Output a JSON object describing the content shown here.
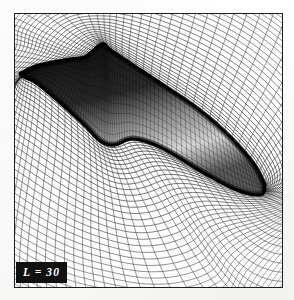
{
  "figure": {
    "kind": "cfd-computational-grid",
    "caption_label": "L = 30",
    "frame": {
      "x": 14,
      "y": 13,
      "width": 269,
      "height": 275,
      "border_color": "#1d1d1d",
      "background_color": "#ffffff"
    },
    "label_badge": {
      "text": "L = 30",
      "background_color": "#111111",
      "text_color": "#ffffff",
      "position": "bottom-left"
    },
    "grid": {
      "type": "body-fitted-c-grid",
      "line_color": "#2a2a2a",
      "radial_lines": 96,
      "circumferential_lines": 44,
      "description": "Curvilinear body-fitted mesh wrapped around slender hull"
    },
    "body": {
      "name": "slender-hull",
      "fill_color": "#151515",
      "nose_point": [
        18,
        72
      ],
      "tail_point": [
        255,
        185
      ],
      "features": [
        "sail-fin",
        "lower-bulge",
        "tapered-tail"
      ]
    }
  },
  "chart_data": {
    "type": "line",
    "title": "L = 30",
    "xlabel": "",
    "ylabel": "",
    "xlim": [
      0,
      269
    ],
    "ylim": [
      0,
      275
    ],
    "grid": true,
    "legend": "none",
    "annotations": [
      "L = 30"
    ],
    "series": [
      {
        "name": "body-surface-outline",
        "x": [
          5,
          22,
          52,
          68,
          75,
          88,
          96,
          120,
          150,
          185,
          215,
          240,
          252,
          248,
          225,
          190,
          150,
          120,
          100,
          86,
          70,
          46,
          22,
          10,
          5
        ],
        "y": [
          60,
          52,
          46,
          44,
          40,
          30,
          36,
          52,
          72,
          96,
          122,
          150,
          172,
          182,
          178,
          160,
          136,
          126,
          132,
          128,
          112,
          90,
          70,
          64,
          60
        ]
      },
      {
        "name": "grid-outer-boundary",
        "x": [
          0,
          269,
          269,
          0,
          0
        ],
        "y": [
          0,
          0,
          275,
          275,
          0
        ]
      }
    ]
  }
}
